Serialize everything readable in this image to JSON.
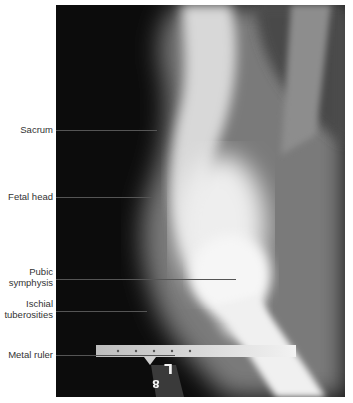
{
  "image": {
    "type": "lateral pelvic radiograph (X-ray)",
    "film_marker": {
      "letter": "L",
      "digit": "8"
    }
  },
  "labels": [
    {
      "id": "sacrum",
      "text": "Sacrum",
      "label_y": 130,
      "line_end_x": 157
    },
    {
      "id": "fetal-head",
      "text": "Fetal head",
      "label_y": 197,
      "line_end_x": 152
    },
    {
      "id": "pubic-symphysis",
      "line1": "Pubic",
      "line2": "symphysis",
      "label_y": 279,
      "line_end_x": 236
    },
    {
      "id": "ischial-tuberosities",
      "line1": "Ischial",
      "line2": "tuberosities",
      "label_y": 311,
      "line_end_x": 147
    },
    {
      "id": "metal-ruler",
      "text": "Metal ruler",
      "label_y": 355,
      "line_end_x": 175
    }
  ],
  "colors": {
    "background": "#ffffff",
    "label_text": "#333333",
    "leader_line": "#555555",
    "film_dark": "#0c0c0c"
  }
}
